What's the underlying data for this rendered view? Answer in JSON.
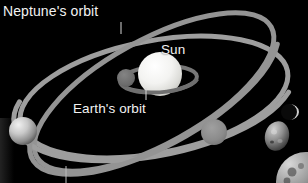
{
  "figure": {
    "kind": "astronomy-diagram",
    "background_color": "#000000",
    "orbit_color": "#9a9a9a",
    "label_color": "#f2f2f2"
  },
  "labels": {
    "neptune_orbit": "Neptune's orbit",
    "sun": "Sun",
    "earth_orbit": "Earth's orbit"
  },
  "bodies": {
    "sun": {
      "name": "Sun",
      "color": "#f0f0ee"
    },
    "planet_left": {
      "name": "planet-left",
      "color": "#bdbdbd"
    },
    "planet_right": {
      "name": "planet-right",
      "color": "#8a8a8a"
    },
    "planet_inner": {
      "name": "planet-inner",
      "color": "#6e6e6e"
    }
  },
  "orbits": {
    "neptune": {
      "name": "Neptune's orbit",
      "color": "#a0a0a0"
    },
    "pluto": {
      "name": "inclined-orbit",
      "color": "#9c9c9c"
    },
    "earth": {
      "name": "Earth's orbit",
      "color": "#7a7a7a"
    }
  },
  "leader_lines": {
    "neptune": "leader-line-neptune",
    "earth": "leader-line-earth",
    "bottom": "leader-line-bottom"
  }
}
